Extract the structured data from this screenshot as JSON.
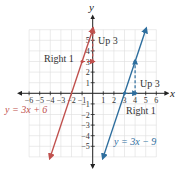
{
  "chart_data": {
    "type": "line",
    "title": "",
    "xlabel": "x",
    "ylabel": "y",
    "xlim": [
      -6,
      6
    ],
    "ylim": [
      -6,
      6
    ],
    "grid": true,
    "x_ticks": [
      -6,
      -5,
      -4,
      -3,
      -2,
      -1,
      1,
      2,
      3,
      4,
      5,
      6
    ],
    "y_ticks": [
      -5,
      -4,
      -3,
      -2,
      -1,
      1,
      2,
      3,
      4,
      5
    ],
    "series": [
      {
        "name": "y = 3x + 6",
        "slope": 3,
        "intercept": 6,
        "color": "#c0504d",
        "x": [
          -4,
          0
        ],
        "y": [
          -6,
          6
        ]
      },
      {
        "name": "y = 3x − 9",
        "slope": 3,
        "intercept": -9,
        "color": "#2e6e9e",
        "x": [
          1,
          5
        ],
        "y": [
          -6,
          6
        ]
      }
    ],
    "annotations": [
      {
        "text": "Right 1",
        "series": "y = 3x + 6",
        "from": [
          -1,
          3
        ],
        "to": [
          0,
          3
        ]
      },
      {
        "text": "Up 3",
        "series": "y = 3x + 6",
        "from": [
          0,
          3
        ],
        "to": [
          0,
          6
        ]
      },
      {
        "text": "Up 3",
        "series": "y = 3x − 9",
        "from": [
          4,
          0
        ],
        "to": [
          4,
          3
        ]
      },
      {
        "text": "Right 1",
        "series": "y = 3x − 9",
        "from": [
          3,
          0
        ],
        "to": [
          4,
          0
        ]
      }
    ]
  },
  "labels": {
    "x_axis": "x",
    "y_axis": "y",
    "eq_red": "y = 3x + 6",
    "eq_blue": "y = 3x − 9",
    "right1_red": "Right 1",
    "up3_red": "Up 3",
    "up3_blue": "Up 3",
    "right1_blue": "Right 1"
  },
  "colors": {
    "red": "#c0504d",
    "blue": "#2e6e9e",
    "grid": "#dddddd",
    "axis": "#222222"
  }
}
